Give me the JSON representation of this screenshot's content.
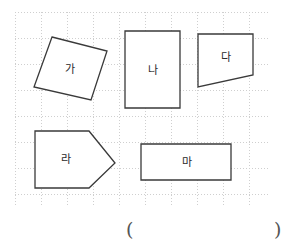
{
  "page": {
    "width": 292,
    "height": 247,
    "background": "#ffffff",
    "kind": "geometry-worksheet"
  },
  "grid": {
    "left": 15,
    "top": 12,
    "width": 255,
    "height": 193,
    "cell_size": 26,
    "line_color": "#cfcfcf",
    "style": "dotted",
    "columns": 10,
    "rows": 8
  },
  "shapes": {
    "stroke_color": "#3a3a3a",
    "fill_color": "#ffffff",
    "stroke_width": 1.3,
    "items": [
      {
        "id": "ga",
        "label": "가",
        "type": "quadrilateral",
        "points": "52,37 107,51 91,100 34,87",
        "label_x": 70,
        "label_y": 69
      },
      {
        "id": "na",
        "label": "나",
        "type": "rectangle",
        "points": "125,31 180,31 180,108 125,108",
        "label_x": 153,
        "label_y": 70
      },
      {
        "id": "da",
        "label": "다",
        "type": "trapezoid",
        "points": "198,34 253,34 253,75 198,87",
        "label_x": 226,
        "label_y": 57
      },
      {
        "id": "ra",
        "label": "라",
        "type": "pentagon",
        "points": "35,131 89,131 115,163 89,188 35,188",
        "label_x": 66,
        "label_y": 159
      },
      {
        "id": "ma",
        "label": "마",
        "type": "rectangle",
        "points": "141,144 231,144 231,180 141,180",
        "label_x": 187,
        "label_y": 162
      }
    ]
  },
  "answer": {
    "open_paren": "(",
    "close_paren": ")"
  }
}
